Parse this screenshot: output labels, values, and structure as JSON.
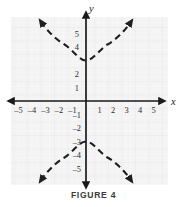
{
  "figure": {
    "caption": "FIGURE 4",
    "x_axis_label": "x",
    "y_axis_label": "y"
  },
  "colors": {
    "grid_background": "#f3f3f3",
    "grid_minor_line": "#fbfbfb",
    "grid_major_line": "#e6e6e6",
    "axis": "#1a1a1a",
    "curve": "#1f1f1f",
    "tick_text": "#2b2b2b",
    "caption_text": "#3a3a3a"
  },
  "chart_data": {
    "type": "line",
    "title": "FIGURE 4",
    "xlabel": "x",
    "ylabel": "y",
    "grid": true,
    "legend": null,
    "xlim": [
      -5.8,
      5.8
    ],
    "ylim": [
      -6.2,
      6.2
    ],
    "x_ticks": [
      -5,
      -4,
      -3,
      -2,
      -1,
      1,
      2,
      3,
      4,
      5
    ],
    "y_ticks": [
      5,
      4,
      2,
      1,
      -1,
      -2,
      -3,
      -4,
      -5
    ],
    "x_tick_labels": [
      "-5",
      "-4",
      "-3",
      "-2",
      "-1",
      "1",
      "2",
      "3",
      "4",
      "5"
    ],
    "y_tick_labels": [
      "5",
      "4",
      "2",
      "1",
      "-1",
      "-2",
      "-3",
      "-4",
      "-5"
    ],
    "annotations": [],
    "series": [
      {
        "name": "upper-branch",
        "style": "dashed",
        "arrows": "both",
        "vertex": [
          0,
          3
        ],
        "equation": "y = 3*sqrt(1 + x^2/9)",
        "points": [
          [
            -4.1,
            5.9
          ],
          [
            -3.5,
            4.6
          ],
          [
            -3.0,
            4.24
          ],
          [
            -2.5,
            3.9
          ],
          [
            -2.0,
            3.6
          ],
          [
            -1.5,
            3.35
          ],
          [
            -1.0,
            3.16
          ],
          [
            -0.5,
            3.04
          ],
          [
            0,
            3.0
          ],
          [
            0.5,
            3.04
          ],
          [
            1.0,
            3.16
          ],
          [
            1.5,
            3.35
          ],
          [
            2.0,
            3.6
          ],
          [
            2.5,
            3.9
          ],
          [
            3.0,
            4.24
          ],
          [
            3.5,
            4.6
          ],
          [
            4.1,
            5.9
          ]
        ]
      },
      {
        "name": "lower-branch",
        "style": "dashed",
        "arrows": "both",
        "vertex": [
          0,
          -3
        ],
        "equation": "y = -3*sqrt(1 + x^2/9)",
        "points": [
          [
            -4.1,
            -5.9
          ],
          [
            -3.5,
            -4.6
          ],
          [
            -3.0,
            -4.24
          ],
          [
            -2.5,
            -3.9
          ],
          [
            -2.0,
            -3.6
          ],
          [
            -1.5,
            -3.35
          ],
          [
            -1.0,
            -3.16
          ],
          [
            -0.5,
            -3.04
          ],
          [
            0,
            -3.0
          ],
          [
            0.5,
            -3.04
          ],
          [
            1.0,
            -3.16
          ],
          [
            1.5,
            -3.35
          ],
          [
            2.0,
            -3.6
          ],
          [
            2.5,
            -3.9
          ],
          [
            3.0,
            -4.24
          ],
          [
            3.5,
            -4.6
          ],
          [
            4.1,
            -5.9
          ]
        ]
      }
    ]
  }
}
